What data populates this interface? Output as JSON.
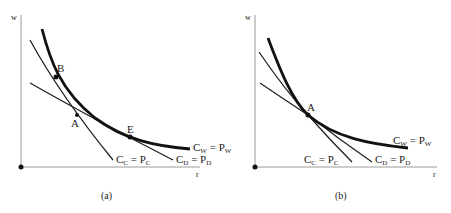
{
  "figure": {
    "panels": [
      {
        "id": "a",
        "caption": "(a)",
        "y_axis_label": "w",
        "x_axis_label": "r",
        "points": [
          {
            "name": "B",
            "label": "B"
          },
          {
            "name": "A",
            "label": "A"
          },
          {
            "name": "E",
            "label": "E"
          }
        ],
        "curves": [
          {
            "name": "cc",
            "label_main": "C",
            "label_sub": "C",
            "label_eq": " = P",
            "label_sub2": "C",
            "weight": "thin"
          },
          {
            "name": "cd",
            "label_main": "C",
            "label_sub": "D",
            "label_eq": " = P",
            "label_sub2": "D",
            "weight": "thin"
          },
          {
            "name": "cw",
            "label_main": "C",
            "label_sub": "W",
            "label_eq": " = P",
            "label_sub2": "W",
            "weight": "thick"
          }
        ]
      },
      {
        "id": "b",
        "caption": "(b)",
        "y_axis_label": "w",
        "x_axis_label": "r",
        "points": [
          {
            "name": "A",
            "label": "A"
          }
        ],
        "curves": [
          {
            "name": "cc",
            "label_main": "C",
            "label_sub": "C",
            "label_eq": " = P",
            "label_sub2": "C",
            "weight": "thin"
          },
          {
            "name": "cd",
            "label_main": "C",
            "label_sub": "D",
            "label_eq": " = P",
            "label_sub2": "D",
            "weight": "thin"
          },
          {
            "name": "cw",
            "label_main": "C",
            "label_sub": "W",
            "label_eq": " = P",
            "label_sub2": "W",
            "weight": "thick"
          }
        ]
      }
    ]
  },
  "colors": {
    "ink": "#222222",
    "axis": "#9a9a9a",
    "background": "#ffffff"
  }
}
